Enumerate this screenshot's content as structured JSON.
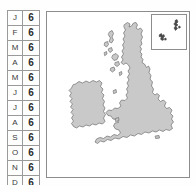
{
  "legend": {
    "name": "monthly-value-table",
    "rows": [
      {
        "month": "J",
        "value": "6"
      },
      {
        "month": "F",
        "value": "6"
      },
      {
        "month": "M",
        "value": "6"
      },
      {
        "month": "A",
        "value": "6"
      },
      {
        "month": "M",
        "value": "6"
      },
      {
        "month": "J",
        "value": "6"
      },
      {
        "month": "J",
        "value": "6"
      },
      {
        "month": "A",
        "value": "6"
      },
      {
        "month": "S",
        "value": "6"
      },
      {
        "month": "O",
        "value": "6"
      },
      {
        "month": "N",
        "value": "6"
      },
      {
        "month": "D",
        "value": "6"
      }
    ]
  },
  "map": {
    "name": "british-isles-map",
    "land_color": "#c9c9c9",
    "land_stroke": "#6e6e6e",
    "sea_color": "#ffffff",
    "frame_color": "#8d8d8d",
    "regions": [
      {
        "name": "great-britain"
      },
      {
        "name": "ireland"
      },
      {
        "name": "hebrides-islands"
      },
      {
        "name": "isle-of-man"
      },
      {
        "name": "isle-of-wight"
      },
      {
        "name": "anglesey"
      }
    ],
    "inset": {
      "name": "northern-isles-inset",
      "regions": [
        {
          "name": "shetland-islands"
        },
        {
          "name": "orkney-islands"
        }
      ]
    }
  }
}
